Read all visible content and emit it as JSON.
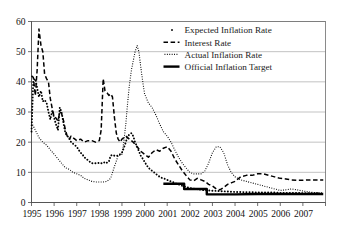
{
  "chart_data": {
    "type": "line",
    "title": "",
    "subtitle": "",
    "xlabel": "",
    "ylabel": "",
    "xlim": [
      1995.0,
      2008.0
    ],
    "ylim": [
      0,
      60
    ],
    "yticks": [
      0,
      10,
      20,
      30,
      40,
      50,
      60
    ],
    "ytick_labels": [
      "0",
      "10",
      "20",
      "30",
      "40",
      "50",
      "60"
    ],
    "xticks": [
      1995,
      1996,
      1997,
      1998,
      1999,
      2000,
      2001,
      2002,
      2003,
      2004,
      2005,
      2006,
      2007
    ],
    "xtick_labels": [
      "1995",
      "1996",
      "1997",
      "1998",
      "1999",
      "2000",
      "2001",
      "2002",
      "2003",
      "2004",
      "2005",
      "2006",
      "2007"
    ],
    "grid": "horizontal",
    "legend_position": "upper-right",
    "series": [
      {
        "name": "Expected Inflation Rate",
        "style": "dotted-markers",
        "color": "#000000",
        "x": [
          1995.0,
          1995.08,
          1995.17,
          1995.25,
          1995.33,
          1995.42,
          1995.5,
          1995.58,
          1995.67,
          1995.75,
          1995.83,
          1995.92,
          1996.0,
          1996.08,
          1996.17,
          1996.25,
          1996.33,
          1996.42,
          1996.5,
          1996.58,
          1996.67,
          1996.75,
          1996.83,
          1996.92,
          1997.0,
          1997.08,
          1997.17,
          1997.25,
          1997.33,
          1997.42,
          1997.5,
          1997.58,
          1997.67,
          1997.75,
          1997.83,
          1997.92,
          1998.0,
          1998.08,
          1998.17,
          1998.25,
          1998.33,
          1998.42,
          1998.5,
          1998.58,
          1998.67,
          1998.75,
          1998.83,
          1998.92,
          1999.0,
          1999.08,
          1999.17,
          1999.25,
          1999.33,
          1999.42,
          1999.5,
          1999.58,
          1999.67,
          1999.75,
          1999.83,
          1999.92,
          2000.0,
          2000.08,
          2000.17,
          2000.25,
          2000.33,
          2000.42,
          2000.5,
          2000.58,
          2000.67,
          2000.75,
          2000.83,
          2000.92,
          2001.0,
          2001.08,
          2001.17,
          2001.25,
          2001.33,
          2001.42,
          2001.5,
          2001.58,
          2001.67,
          2001.75,
          2001.83,
          2001.92,
          2002.0,
          2002.25,
          2002.5,
          2002.75,
          2003.0,
          2003.25,
          2003.5,
          2003.75,
          2004.0,
          2004.25,
          2004.5,
          2004.75,
          2005.0,
          2005.25,
          2005.5,
          2005.75,
          2006.0,
          2006.25,
          2006.5,
          2006.75,
          2007.0,
          2007.25,
          2007.5,
          2007.75
        ],
        "y": [
          23.5,
          40.5,
          41.0,
          38.0,
          35.0,
          37.0,
          33.5,
          34.0,
          33.0,
          30.0,
          27.5,
          30.5,
          28.0,
          26.0,
          24.0,
          31.5,
          30.0,
          26.0,
          23.0,
          22.0,
          21.5,
          20.0,
          19.5,
          19.0,
          18.5,
          17.5,
          16.5,
          16.0,
          15.0,
          14.5,
          14.0,
          13.5,
          13.0,
          13.0,
          13.0,
          13.0,
          13.2,
          13.0,
          13.0,
          13.5,
          13.2,
          13.5,
          15.5,
          15.8,
          15.5,
          15.5,
          15.5,
          16.0,
          16.5,
          18.0,
          20.0,
          22.0,
          22.5,
          23.0,
          22.0,
          20.0,
          18.5,
          17.0,
          15.5,
          14.5,
          13.5,
          12.5,
          11.5,
          11.0,
          10.5,
          10.0,
          9.5,
          9.0,
          8.5,
          8.2,
          8.0,
          7.8,
          7.5,
          7.2,
          7.0,
          6.8,
          6.5,
          6.2,
          6.0,
          5.8,
          5.5,
          5.3,
          5.2,
          5.0,
          4.8,
          4.5,
          4.2,
          4.0,
          3.9,
          3.8,
          3.7,
          3.6,
          3.5,
          3.5,
          3.4,
          3.4,
          3.3,
          3.3,
          3.3,
          3.3,
          3.2,
          3.2,
          3.2,
          3.2,
          3.1,
          3.1,
          3.1,
          3.1
        ]
      },
      {
        "name": "Interest Rate",
        "style": "dashed",
        "color": "#000000",
        "x": [
          1995.0,
          1995.08,
          1995.17,
          1995.25,
          1995.33,
          1995.42,
          1995.5,
          1995.58,
          1995.67,
          1995.75,
          1995.83,
          1995.92,
          1996.0,
          1996.08,
          1996.17,
          1996.25,
          1996.33,
          1996.42,
          1996.5,
          1996.58,
          1996.67,
          1996.75,
          1996.83,
          1996.92,
          1997.0,
          1997.17,
          1997.33,
          1997.5,
          1997.67,
          1997.83,
          1998.0,
          1998.08,
          1998.17,
          1998.25,
          1998.33,
          1998.42,
          1998.5,
          1998.58,
          1998.67,
          1998.75,
          1998.83,
          1998.92,
          1999.0,
          1999.17,
          1999.33,
          1999.5,
          1999.67,
          1999.83,
          2000.0,
          2000.17,
          2000.33,
          2000.5,
          2000.67,
          2000.83,
          2001.0,
          2001.17,
          2001.33,
          2001.5,
          2001.67,
          2001.83,
          2002.0,
          2002.17,
          2002.33,
          2002.5,
          2002.67,
          2002.83,
          2003.0,
          2003.17,
          2003.33,
          2003.5,
          2003.67,
          2003.83,
          2004.0,
          2004.25,
          2004.5,
          2004.75,
          2005.0,
          2005.25,
          2005.5,
          2005.75,
          2006.0,
          2006.25,
          2006.5,
          2006.75,
          2007.0,
          2007.25,
          2007.5,
          2007.9
        ],
        "y": [
          42.0,
          41.5,
          35.5,
          44.0,
          57.5,
          52.0,
          50.0,
          42.5,
          41.0,
          40.0,
          34.5,
          31.0,
          28.5,
          28.0,
          27.0,
          30.0,
          29.5,
          27.0,
          24.0,
          22.0,
          21.0,
          22.0,
          21.5,
          21.0,
          20.5,
          21.0,
          20.0,
          20.5,
          20.5,
          20.0,
          20.5,
          24.0,
          41.0,
          37.0,
          36.5,
          35.5,
          36.0,
          35.0,
          28.0,
          23.0,
          21.0,
          20.0,
          21.0,
          22.0,
          21.0,
          20.0,
          18.5,
          17.0,
          16.0,
          15.0,
          16.5,
          17.5,
          17.0,
          18.0,
          18.5,
          17.0,
          14.5,
          12.5,
          10.5,
          9.0,
          7.5,
          7.2,
          8.0,
          7.5,
          7.0,
          6.0,
          5.5,
          4.5,
          4.2,
          5.0,
          6.0,
          6.5,
          7.0,
          8.5,
          9.0,
          9.0,
          9.5,
          9.5,
          9.0,
          8.5,
          8.0,
          7.8,
          7.5,
          7.4,
          7.4,
          7.5,
          7.5,
          7.5
        ]
      },
      {
        "name": "Actual Inflation Rate",
        "style": "fine-dotted",
        "color": "#000000",
        "x": [
          1995.0,
          1995.17,
          1995.33,
          1995.5,
          1995.67,
          1995.83,
          1996.0,
          1996.17,
          1996.33,
          1996.5,
          1996.67,
          1996.83,
          1997.0,
          1997.17,
          1997.33,
          1997.5,
          1997.67,
          1997.83,
          1998.0,
          1998.17,
          1998.33,
          1998.5,
          1998.67,
          1998.83,
          1999.0,
          1999.08,
          1999.17,
          1999.25,
          1999.33,
          1999.42,
          1999.5,
          1999.58,
          1999.67,
          1999.75,
          1999.83,
          1999.92,
          2000.0,
          2000.17,
          2000.33,
          2000.5,
          2000.67,
          2000.83,
          2001.0,
          2001.17,
          2001.33,
          2001.5,
          2001.67,
          2001.83,
          2002.0,
          2002.17,
          2002.33,
          2002.5,
          2002.67,
          2002.83,
          2003.0,
          2003.17,
          2003.33,
          2003.5,
          2003.67,
          2003.83,
          2004.0,
          2004.25,
          2004.5,
          2004.75,
          2005.0,
          2005.25,
          2005.5,
          2005.75,
          2006.0,
          2006.25,
          2006.5,
          2006.75,
          2007.0,
          2007.25,
          2007.5,
          2007.9
        ],
        "y": [
          26.5,
          24.0,
          21.5,
          20.0,
          19.0,
          17.5,
          16.0,
          14.5,
          13.0,
          11.5,
          11.0,
          10.0,
          9.5,
          9.0,
          8.0,
          7.5,
          7.0,
          6.8,
          6.8,
          6.8,
          7.0,
          8.0,
          12.0,
          15.5,
          16.0,
          20.0,
          26.0,
          33.0,
          39.0,
          44.0,
          47.0,
          50.0,
          52.0,
          50.0,
          45.0,
          40.0,
          36.0,
          33.0,
          31.5,
          29.0,
          26.0,
          23.5,
          22.0,
          20.0,
          17.5,
          15.0,
          13.0,
          11.5,
          10.0,
          9.5,
          9.5,
          9.5,
          10.5,
          13.0,
          16.5,
          18.5,
          18.5,
          16.5,
          12.5,
          10.0,
          8.5,
          7.5,
          7.0,
          6.5,
          6.0,
          5.5,
          5.0,
          4.5,
          4.0,
          4.2,
          4.5,
          4.2,
          3.8,
          3.5,
          3.3,
          3.2
        ]
      },
      {
        "name": "Official Inflation Target",
        "style": "solid-thick",
        "color": "#000000",
        "x": [
          2000.83,
          2001.0,
          2001.5,
          2001.75,
          2001.75,
          2002.0,
          2002.75,
          2002.75,
          2003.0,
          2004.0,
          2005.0,
          2006.0,
          2007.0,
          2007.9
        ],
        "y": [
          6.2,
          6.2,
          6.2,
          6.2,
          4.5,
          4.5,
          4.5,
          2.7,
          2.7,
          2.7,
          2.8,
          2.8,
          2.8,
          2.8
        ]
      }
    ]
  },
  "legend": {
    "items": [
      {
        "label": "Expected Inflation Rate",
        "marker": "dot-marker"
      },
      {
        "label": "Interest Rate",
        "marker": "dashed-line"
      },
      {
        "label": "Actual Inflation Rate",
        "marker": "dotted-line"
      },
      {
        "label": "Official Inflation Target",
        "marker": "solid-line"
      }
    ]
  },
  "axes": {
    "y_labels": [
      "60",
      "50",
      "40",
      "30",
      "20",
      "10",
      "0"
    ],
    "x_labels": [
      "1995",
      "1996",
      "1997",
      "1998",
      "1999",
      "2000",
      "2001",
      "2002",
      "2003",
      "2004",
      "2005",
      "2006",
      "2007"
    ]
  },
  "colors": {
    "ink": "#000000",
    "grid": "#9b9b9b",
    "frame": "#6e6e6e",
    "background": "#ffffff"
  }
}
